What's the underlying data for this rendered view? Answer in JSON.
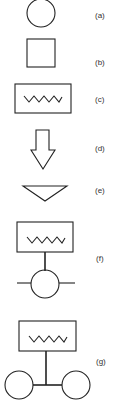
{
  "figure": {
    "symbols": [
      {
        "id": "a",
        "label": "(a)",
        "shape": "circle"
      },
      {
        "id": "b",
        "label": "(b)",
        "shape": "square"
      },
      {
        "id": "c",
        "label": "(c)",
        "shape": "rectangle-with-zigzag"
      },
      {
        "id": "d",
        "label": "(d)",
        "shape": "down-arrow"
      },
      {
        "id": "e",
        "label": "(e)",
        "shape": "inverted-triangle"
      },
      {
        "id": "f",
        "label": "(f)",
        "shape": "zigzag-box-over-circle-with-line"
      },
      {
        "id": "g",
        "label": "(g)",
        "shape": "zigzag-box-over-two-circles"
      }
    ]
  }
}
